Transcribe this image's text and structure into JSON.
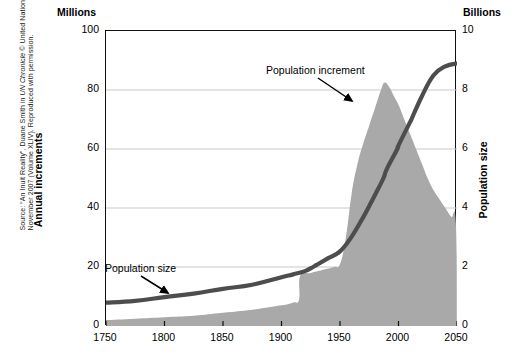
{
  "source_note": {
    "prefix": "Source: “An Inuit Reality”, Duane Smith in ",
    "italic": "UN Chronicle",
    "suffix": " © United Nations, November 2007 (Volume XLIV). Reproduced with permission."
  },
  "units": {
    "left": "Millions",
    "right": "Billions"
  },
  "annotations": {
    "increment": "Population increment",
    "size": "Population size"
  },
  "colors": {
    "area_fill": "#a9a9a9",
    "line": "#4d4d4d",
    "frame": "#111111",
    "gridline": "#c9c9c9",
    "text": "#000000"
  },
  "chart_data": {
    "type": "area",
    "title": "",
    "subtitle": "",
    "xlabel": "",
    "ylabel": "Annual increments",
    "y2label": "Population size",
    "xlim": [
      1750,
      2050
    ],
    "ylim": [
      0,
      100
    ],
    "y2lim": [
      0,
      10
    ],
    "xticks": [
      1750,
      1800,
      1850,
      1900,
      1950,
      2000,
      2050
    ],
    "yticks": [
      0,
      20,
      40,
      60,
      80,
      100
    ],
    "y2ticks": [
      0,
      2,
      4,
      6,
      8,
      10
    ],
    "grid": "horizontal",
    "legend": "none",
    "series": [
      {
        "name": "Population increment",
        "type": "area",
        "axis": "left",
        "units": "Millions per year",
        "color": "#a9a9a9",
        "x": [
          1750,
          1775,
          1800,
          1825,
          1850,
          1875,
          1900,
          1910,
          1915,
          1916,
          1925,
          1935,
          1945,
          1950,
          1955,
          1960,
          1965,
          1970,
          1975,
          1980,
          1985,
          1988,
          1992,
          1996,
          2000,
          2005,
          2010,
          2015,
          2020,
          2025,
          2030,
          2035,
          2040,
          2045,
          2049,
          2050
        ],
        "y": [
          2,
          2.5,
          3,
          3.5,
          4.5,
          5.5,
          7,
          8,
          9,
          17,
          18,
          19,
          20,
          21,
          30,
          45,
          55,
          62,
          68,
          74,
          80,
          82.5,
          81,
          78,
          75,
          70,
          65,
          60,
          55,
          50,
          46,
          43,
          40,
          37,
          35,
          0
        ]
      },
      {
        "name": "Population size",
        "type": "line",
        "axis": "right",
        "units": "Billions",
        "color": "#4d4d4d",
        "x": [
          1750,
          1775,
          1800,
          1825,
          1850,
          1875,
          1900,
          1910,
          1920,
          1927,
          1930,
          1940,
          1950,
          1960,
          1970,
          1975,
          1980,
          1987,
          1990,
          1999,
          2000,
          2010,
          2011,
          2020,
          2030,
          2040,
          2050
        ],
        "y": [
          0.79,
          0.85,
          0.98,
          1.1,
          1.26,
          1.4,
          1.65,
          1.75,
          1.86,
          2.0,
          2.07,
          2.3,
          2.53,
          3.03,
          3.7,
          4.07,
          4.45,
          5.0,
          5.32,
          6.0,
          6.12,
          6.92,
          7.0,
          7.79,
          8.5,
          8.8,
          8.9
        ]
      }
    ],
    "annotations": [
      {
        "text": "Population increment",
        "x": 1965,
        "y": 88,
        "points_to": {
          "x": 1978,
          "y": 78
        }
      },
      {
        "text": "Population size",
        "x": 1763,
        "y": 22,
        "points_to": {
          "x": 1800,
          "y": 12
        }
      }
    ]
  }
}
